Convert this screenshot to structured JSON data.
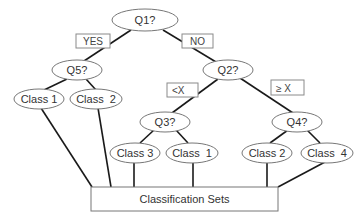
{
  "diagram": {
    "type": "decision-tree",
    "nodes": {
      "q1": "Q1?",
      "q5": "Q5?",
      "q2": "Q2?",
      "q3": "Q3?",
      "q4": "Q4?",
      "leaf_q5_left": "Class 1",
      "leaf_q5_right": "Class  2",
      "leaf_q3_left": "Class 3",
      "leaf_q3_right": "Class  1",
      "leaf_q4_left": "Class 2",
      "leaf_q4_right": "Class  4"
    },
    "edge_labels": {
      "q1_yes": "YES",
      "q1_no": "NO",
      "q2_lt": "<X",
      "q2_ge": "≥ X"
    },
    "sink": "Classification Sets",
    "colors": {
      "edge": "#1a1a1a",
      "node_border": "#777777",
      "text": "#333333"
    }
  }
}
